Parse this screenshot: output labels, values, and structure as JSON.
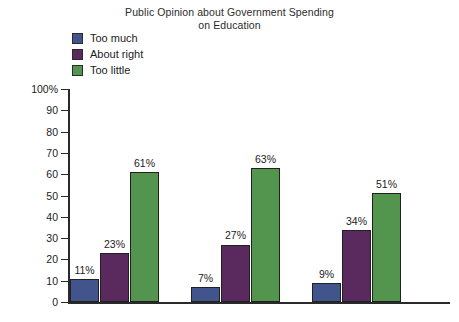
{
  "chart_data": {
    "type": "bar",
    "title": "Public Opinion about Government Spending on Education",
    "title_lines": [
      "Public Opinion about Government Spending",
      "on Education"
    ],
    "xlabel": "",
    "ylabel": "",
    "ylim": [
      0,
      100
    ],
    "y_ticks": [
      100,
      90,
      80,
      70,
      60,
      50,
      40,
      30,
      20,
      10,
      0
    ],
    "y_tick_labels": [
      "100%",
      "90",
      "80",
      "70",
      "60",
      "50",
      "40",
      "30",
      "20",
      "10",
      "0"
    ],
    "grid": false,
    "legend_position": "top-left",
    "categories": [
      "Group 1",
      "Group 2",
      "Group 3"
    ],
    "series": [
      {
        "name": "Too much",
        "color": "#41558c",
        "values": [
          11,
          9,
          7
        ],
        "values_by_group": [
          11,
          7,
          9
        ],
        "labels": [
          "11%",
          "7%",
          "9%"
        ]
      },
      {
        "name": "About right",
        "color": "#5a2a5e",
        "values": [
          23,
          27,
          34
        ],
        "values_by_group": [
          23,
          27,
          34
        ],
        "labels": [
          "23%",
          "27%",
          "34%"
        ]
      },
      {
        "name": "Too little",
        "color": "#53954e",
        "values": [
          61,
          63,
          51
        ],
        "values_by_group": [
          61,
          63,
          51
        ],
        "labels": [
          "61%",
          "63%",
          "51%"
        ]
      }
    ],
    "bars": [
      {
        "group": 0,
        "series": "Too much",
        "value": 11,
        "label": "11%",
        "color": "#41558c"
      },
      {
        "group": 0,
        "series": "About right",
        "value": 23,
        "label": "23%",
        "color": "#5a2a5e"
      },
      {
        "group": 0,
        "series": "Too little",
        "value": 61,
        "label": "61%",
        "color": "#53954e"
      },
      {
        "group": 1,
        "series": "Too much",
        "value": 7,
        "label": "7%",
        "color": "#41558c"
      },
      {
        "group": 1,
        "series": "About right",
        "value": 27,
        "label": "27%",
        "color": "#5a2a5e"
      },
      {
        "group": 1,
        "series": "Too little",
        "value": 63,
        "label": "63%",
        "color": "#53954e"
      },
      {
        "group": 2,
        "series": "Too much",
        "value": 9,
        "label": "9%",
        "color": "#41558c"
      },
      {
        "group": 2,
        "series": "About right",
        "value": 34,
        "label": "34%",
        "color": "#5a2a5e"
      },
      {
        "group": 2,
        "series": "Too little",
        "value": 51,
        "label": "51%",
        "color": "#53954e"
      }
    ]
  },
  "legend": {
    "items": [
      {
        "label": "Too much",
        "color": "#41558c"
      },
      {
        "label": "About right",
        "color": "#5a2a5e"
      },
      {
        "label": "Too little",
        "color": "#53954e"
      }
    ]
  },
  "colors": {
    "too_much": "#41558c",
    "about_right": "#5a2a5e",
    "too_little": "#53954e",
    "axis": "#2a2a2a",
    "text": "#1c1c1c",
    "background": "#ffffff",
    "bar_outline": "#20201f"
  }
}
